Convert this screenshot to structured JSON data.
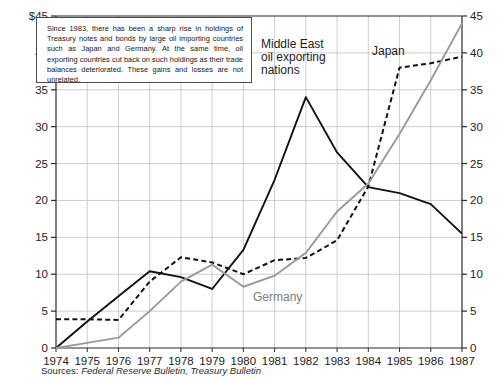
{
  "chart_data": {
    "type": "line",
    "title": "",
    "xlabel": "",
    "ylabel": "",
    "x": [
      1974,
      1975,
      1976,
      1977,
      1978,
      1979,
      1980,
      1981,
      1982,
      1983,
      1984,
      1985,
      1986,
      1987
    ],
    "categories": [
      "1974",
      "1975",
      "1976",
      "1977",
      "1978",
      "1979",
      "1980",
      "1981",
      "1982",
      "1983",
      "1984",
      "1985",
      "1986",
      "1987"
    ],
    "ylim": [
      0,
      45
    ],
    "y_right_lim": [
      0,
      45
    ],
    "y_ticks": [
      0,
      5,
      10,
      15,
      20,
      25,
      30,
      35,
      40,
      45
    ],
    "y_tick_labels_left": [
      "0",
      "5",
      "10",
      "15",
      "20",
      "25",
      "30",
      "35",
      "40",
      "$45"
    ],
    "y_tick_labels_right": [
      "0",
      "5",
      "10",
      "15",
      "20",
      "25",
      "30",
      "35",
      "40",
      "45"
    ],
    "grid": true,
    "legend_position": "inline-annotations",
    "series": [
      {
        "name": "Middle East oil exporting nations",
        "style": "solid",
        "color": "#111111",
        "values": [
          0.0,
          3.6,
          7.0,
          10.4,
          9.6,
          8.0,
          13.3,
          22.8,
          34.0,
          26.5,
          21.8,
          21.0,
          19.5,
          15.5
        ]
      },
      {
        "name": "Japan",
        "style": "dashed",
        "color": "#111111",
        "values": [
          3.9,
          3.9,
          3.8,
          9.0,
          12.3,
          11.6,
          10.0,
          11.9,
          12.2,
          14.6,
          21.9,
          38.0,
          38.6,
          39.5
        ]
      },
      {
        "name": "Germany",
        "style": "solid",
        "color": "#9a9a9a",
        "values": [
          0.0,
          0.7,
          1.4,
          5.0,
          9.0,
          11.3,
          8.3,
          9.8,
          12.9,
          18.5,
          22.3,
          29.0,
          36.3,
          44.0
        ]
      }
    ],
    "annotations": [
      {
        "name": "middle-east-label",
        "text_lines": [
          "Middle East",
          "oil exporting",
          "nations"
        ],
        "x": 261,
        "y": 48
      },
      {
        "name": "japan-label",
        "text_lines": [
          "Japan"
        ],
        "x": 372,
        "y": 55
      },
      {
        "name": "germany-label",
        "text_lines": [
          "Germany"
        ],
        "x": 253,
        "y": 301
      }
    ],
    "note": {
      "text": "Since 1983, there has been a sharp rise in holdings of Treasury notes and bonds by large oil importing countries such as Japan and Germany. At the same time, oil exporting countries cut back on such holdings as their trade balances deteriorated. These gains and losses are not unrelated."
    },
    "source": {
      "lead": "Sources: ",
      "publications": "Federal Reserve Bulletin, Treasury Bulletin"
    }
  }
}
